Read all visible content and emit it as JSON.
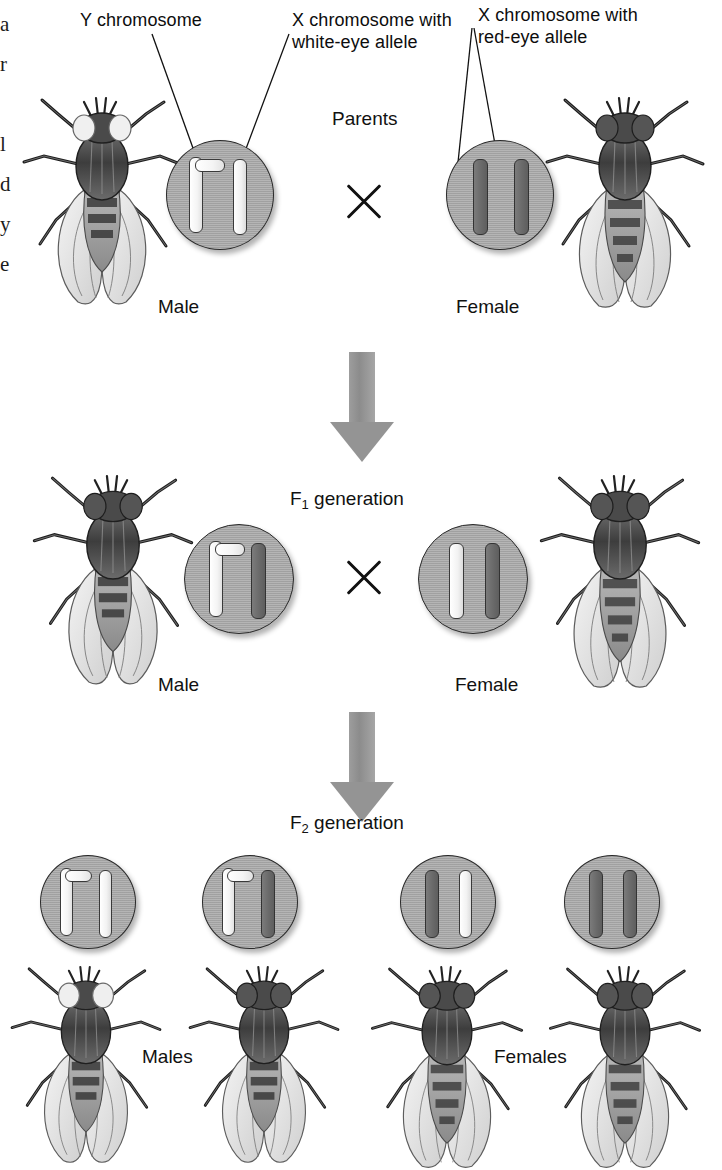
{
  "figure": {
    "bg_color": "#ffffff",
    "cell_fill": "#a9a9a9",
    "chromosome_white": "#ffffff",
    "chromosome_dark": "#6a6a6a",
    "arrow_color": "#949494"
  },
  "edge_column": {
    "lines": [
      "a",
      "r",
      "l",
      "d",
      "y",
      "e"
    ]
  },
  "callouts": [
    {
      "id": "y-chromosome",
      "text": "Y chromosome"
    },
    {
      "id": "x-white-allele",
      "text": "X chromosome with\nwhite-eye allele"
    },
    {
      "id": "x-red-allele",
      "text": "X chromosome with\nred-eye allele"
    }
  ],
  "generations": [
    {
      "id": "parents",
      "label": "Parents",
      "cross_symbol": "×",
      "individuals": [
        {
          "sex_label": "Male",
          "eye_color": "white",
          "chromosomes": [
            {
              "type": "Y",
              "shade": "white"
            },
            {
              "type": "X",
              "shade": "white"
            }
          ]
        },
        {
          "sex_label": "Female",
          "eye_color": "red",
          "chromosomes": [
            {
              "type": "X",
              "shade": "dark"
            },
            {
              "type": "X",
              "shade": "dark"
            }
          ]
        }
      ]
    },
    {
      "id": "f1",
      "label": "F",
      "label_sub": "1",
      "label_rest": " generation",
      "cross_symbol": "×",
      "individuals": [
        {
          "sex_label": "Male",
          "eye_color": "red",
          "chromosomes": [
            {
              "type": "Y",
              "shade": "white"
            },
            {
              "type": "X",
              "shade": "dark"
            }
          ]
        },
        {
          "sex_label": "Female",
          "eye_color": "red",
          "chromosomes": [
            {
              "type": "X",
              "shade": "white"
            },
            {
              "type": "X",
              "shade": "dark"
            }
          ]
        }
      ]
    },
    {
      "id": "f2",
      "label": "F",
      "label_sub": "2",
      "label_rest": " generation",
      "group_labels": {
        "males": "Males",
        "females": "Females"
      },
      "individuals": [
        {
          "sex_label": "Male",
          "eye_color": "white",
          "chromosomes": [
            {
              "type": "Y",
              "shade": "white"
            },
            {
              "type": "X",
              "shade": "white"
            }
          ]
        },
        {
          "sex_label": "Male",
          "eye_color": "red",
          "chromosomes": [
            {
              "type": "Y",
              "shade": "white"
            },
            {
              "type": "X",
              "shade": "dark"
            }
          ]
        },
        {
          "sex_label": "Female",
          "eye_color": "red",
          "chromosomes": [
            {
              "type": "X",
              "shade": "dark"
            },
            {
              "type": "X",
              "shade": "white"
            }
          ]
        },
        {
          "sex_label": "Female",
          "eye_color": "red",
          "chromosomes": [
            {
              "type": "X",
              "shade": "dark"
            },
            {
              "type": "X",
              "shade": "dark"
            }
          ]
        }
      ]
    }
  ]
}
